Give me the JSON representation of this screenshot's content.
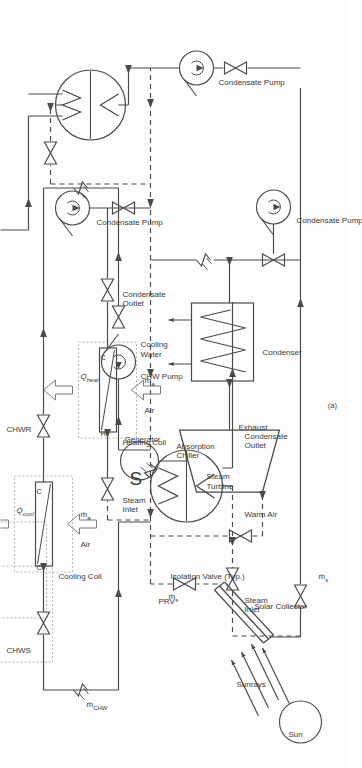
{
  "figure": {
    "caption": "(a)",
    "colors": {
      "line": "#4a4a4a",
      "text": "#3a3a3a",
      "background": "#fdfdfd",
      "dashed_line": "#4a4a4a",
      "coil_box_border": "#9a9a9a"
    }
  },
  "labels": {
    "cold_air": "Cold Air",
    "warm_air": "Warm Air",
    "air_cooling": "Air",
    "air_heating": "Air",
    "chws": "CHWS",
    "chwr": "CHWR",
    "cooling_coil": "Cooling Coil",
    "heating_coil": "Heating Coil",
    "q_cool": "Q̇",
    "q_cool_sub": "cool",
    "q_heat": "Q̇",
    "q_heat_sub": "heat",
    "coil_in_marker_cooling": "C",
    "coil_out_marker_cooling": "C",
    "coil_in_marker_heating": "H",
    "coil_out_marker_heating": "C",
    "m_chw": "ṁ",
    "m_chw_sub": "CHW",
    "m_air_cooling": "ṁ",
    "m_air_cooling_sub": "a",
    "m_air_heating": "ṁ",
    "m_air_heating_sub": "a",
    "m_steam": "ṁ",
    "m_steam_sub": "s",
    "m_steam_2": "ṁ",
    "m_steam_2_sub": "s",
    "absorption_chiller": "Absorption\nChiller",
    "absorption_chiller_l1": "Absorption",
    "absorption_chiller_l2": "Chiller",
    "chw_pump": "CHW Pump",
    "steam_inlet_chiller": "Steam\nInlet",
    "steam_inlet_chiller_l1": "Steam",
    "steam_inlet_chiller_l2": "Inlet",
    "condensate_outlet_chiller_l1": "Condensate",
    "condensate_outlet_chiller_l2": "Outlet",
    "steam_inlet_coil_l1": "Steam",
    "steam_inlet_coil_l2": "Inlet",
    "condensate_outlet_coil_l1": "Condensate",
    "condensate_outlet_coil_l2": "Outlet",
    "condensate_pump_1": "Condensate Pump",
    "condensate_pump_2": "Condensate Pump",
    "condensate_pump_3": "Condensate Pump",
    "prv": "PRV",
    "isolation_valve": "Isolation Valve (Typ.)",
    "steam_turbine_l1": "Steam",
    "steam_turbine_l2": "Turbine",
    "generator": "Generator",
    "generator_symbol": "S",
    "exhaust": "Exhaust",
    "condenser": "Condenser",
    "cooling_water_l1": "Cooling",
    "cooling_water_l2": "Water",
    "solar_collector": "Solar Collector",
    "sunrays": "Sunrays",
    "sun": "Sun"
  },
  "components": [
    {
      "id": "sun",
      "name": "Sun",
      "type": "circle"
    },
    {
      "id": "solar-collector",
      "name": "Solar Collector",
      "type": "flat-plate"
    },
    {
      "id": "prv",
      "name": "PRV",
      "type": "valve"
    },
    {
      "id": "isolation-valve",
      "name": "Isolation Valve (Typ.)",
      "type": "valve"
    },
    {
      "id": "steam-turbine",
      "name": "Steam Turbine",
      "type": "trapezoid"
    },
    {
      "id": "generator",
      "name": "Generator",
      "type": "circle",
      "symbol": "S"
    },
    {
      "id": "condenser",
      "name": "Condenser",
      "type": "heat-exchanger"
    },
    {
      "id": "condensate-pump-1",
      "name": "Condensate Pump",
      "type": "pump"
    },
    {
      "id": "condensate-pump-2",
      "name": "Condensate Pump",
      "type": "pump"
    },
    {
      "id": "condensate-pump-3",
      "name": "Condensate Pump",
      "type": "pump"
    },
    {
      "id": "heating-coil",
      "name": "Heating Coil",
      "type": "coil"
    },
    {
      "id": "absorption-chiller",
      "name": "Absorption Chiller",
      "type": "circle"
    },
    {
      "id": "chw-pump",
      "name": "CHW Pump",
      "type": "pump"
    },
    {
      "id": "cooling-coil",
      "name": "Cooling Coil",
      "type": "coil"
    }
  ],
  "streams": [
    {
      "id": "steam-header",
      "label": "ṁs",
      "style": "dashed"
    },
    {
      "id": "chw-loop",
      "label": "ṁCHW",
      "style": "solid"
    },
    {
      "id": "air-cooling",
      "label": "ṁa",
      "style": "hollow-arrow"
    },
    {
      "id": "air-heating",
      "label": "ṁa",
      "style": "hollow-arrow"
    }
  ]
}
